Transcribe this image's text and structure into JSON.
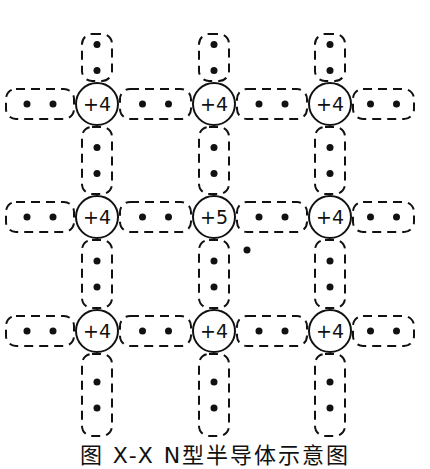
{
  "diagram": {
    "title": "N型半导体示意图",
    "caption": "图 X-X  N型半导体示意图",
    "atoms": [
      {
        "row": 0,
        "col": 0,
        "label": "+4",
        "cx": 97,
        "cy": 104
      },
      {
        "row": 0,
        "col": 1,
        "label": "+4",
        "cx": 214,
        "cy": 104
      },
      {
        "row": 0,
        "col": 2,
        "label": "+4",
        "cx": 330,
        "cy": 104
      },
      {
        "row": 1,
        "col": 0,
        "label": "+4",
        "cx": 97,
        "cy": 217
      },
      {
        "row": 1,
        "col": 1,
        "label": "+5",
        "cx": 214,
        "cy": 217
      },
      {
        "row": 1,
        "col": 2,
        "label": "+4",
        "cx": 330,
        "cy": 217
      },
      {
        "row": 2,
        "col": 0,
        "label": "+4",
        "cx": 97,
        "cy": 331
      },
      {
        "row": 2,
        "col": 1,
        "label": "+4",
        "cx": 214,
        "cy": 331
      },
      {
        "row": 2,
        "col": 2,
        "label": "+4",
        "cx": 330,
        "cy": 331
      }
    ],
    "atom_radius": 21,
    "free_electron": {
      "x": 247,
      "y": 250,
      "note": "extra electron from +5 donor atom"
    },
    "colors": {
      "line": "#111111",
      "background": "#ffffff"
    }
  }
}
